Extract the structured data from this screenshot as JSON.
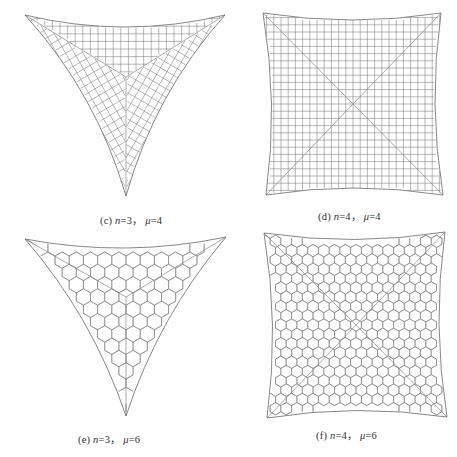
{
  "figure": {
    "panels": [
      {
        "id": "c",
        "label": "(c)",
        "n_label": "n",
        "n_value": "=3",
        "sep": "，",
        "mu_label": "μ",
        "mu_value": "=4",
        "shape": "triangle",
        "grid": "square",
        "caption_pos": [
          100,
          212
        ],
        "vertices": [
          [
            25,
            15
          ],
          [
            225,
            15
          ],
          [
            126,
            196
          ]
        ],
        "center": [
          126,
          77
        ],
        "edge_sag": 12
      },
      {
        "id": "d",
        "label": "(d)",
        "n_label": "n",
        "n_value": "=4",
        "sep": "，",
        "mu_label": "μ",
        "mu_value": "=4",
        "shape": "square",
        "grid": "square",
        "caption_pos": [
          318,
          208
        ],
        "vertices": [
          [
            263,
            13
          ],
          [
            441,
            13
          ],
          [
            443,
            195
          ],
          [
            266,
            195
          ]
        ],
        "center": [
          353,
          104
        ],
        "edge_sag": 7
      },
      {
        "id": "e",
        "label": "(e)",
        "n_label": "n",
        "n_value": "=3",
        "sep": "，",
        "mu_label": "μ",
        "mu_value": "=6",
        "shape": "triangle",
        "grid": "hexagon",
        "caption_pos": [
          78,
          431
        ],
        "vertices": [
          [
            25,
            239
          ],
          [
            226,
            237
          ],
          [
            126,
            416
          ]
        ],
        "center": [
          126,
          297
        ],
        "edge_sag": 10
      },
      {
        "id": "f",
        "label": "(f)",
        "n_label": "n",
        "n_value": "=4",
        "sep": "，",
        "mu_label": "μ",
        "mu_value": "=6",
        "shape": "square",
        "grid": "hexagon",
        "caption_pos": [
          316,
          427
        ],
        "vertices": [
          [
            264,
            233
          ],
          [
            445,
            232
          ],
          [
            447,
            417
          ],
          [
            267,
            418
          ]
        ],
        "center": [
          356,
          325
        ],
        "edge_sag": 7
      }
    ],
    "bottom_caption": ""
  }
}
